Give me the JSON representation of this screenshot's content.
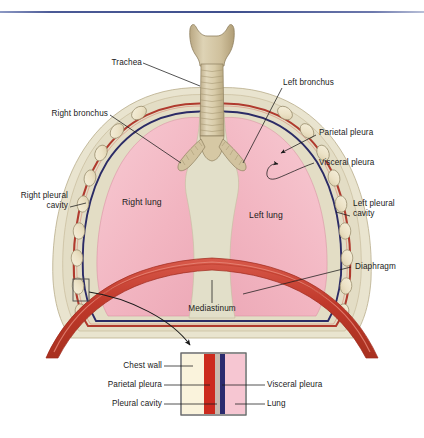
{
  "figure": {
    "background_color": "#ffffff",
    "top_rule_color": "#4b5a96"
  },
  "colors": {
    "lung_pink": "#f4b9c4",
    "lung_pink_light": "#f7c8d1",
    "chest_wall_cream": "#ddd9c3",
    "chest_wall_outer": "#e7e2cc",
    "rib_fill": "#eee6cf",
    "rib_outline": "#9a8e6e",
    "parietal_red": "#b03a2e",
    "visceral_navy": "#2b2b66",
    "diaphragm_red": "#c0392b",
    "diaphragm_red_light": "#e05a4a",
    "mediastinum": "#e0decb",
    "trachea_tan": "#cdbf9e",
    "trachea_light": "#ded2b4",
    "leader_line": "#1a1a1a",
    "label_text": "#1a1a1a",
    "inset_chest_wall": "#faf3dc",
    "inset_parietal": "#cc2a1e",
    "inset_cavity": "#2b2b6e",
    "inset_lung": "#f6c6d2",
    "inset_border": "#6b6b6b"
  },
  "labels": {
    "trachea": "Trachea",
    "right_bronchus": "Right bronchus",
    "left_bronchus": "Left bronchus",
    "parietal_pleura": "Parietal pleura",
    "visceral_pleura": "Visceral pleura",
    "right_pleural_cavity_line1": "Right pleural",
    "right_pleural_cavity_line2": "cavity",
    "left_pleural_cavity_line1": "Left pleural",
    "left_pleural_cavity_line2": "cavity",
    "right_lung": "Right lung",
    "left_lung": "Left lung",
    "diaphragm": "Diaphragm",
    "mediastinum": "Mediastinum"
  },
  "inset": {
    "left_labels": [
      "Chest wall",
      "Parietal pleura",
      "Pleural cavity"
    ],
    "right_labels": [
      "Visceral pleura",
      "Lung"
    ],
    "layers": [
      {
        "name": "chest wall",
        "color": "#faf3dc",
        "width": 22
      },
      {
        "name": "parietal pleura",
        "color": "#cc2a1e",
        "width": 11
      },
      {
        "name": "pleural cavity",
        "color": "#c8b8ae",
        "width": 5
      },
      {
        "name": "visceral pleura",
        "color": "#2b2b6e",
        "width": 5
      },
      {
        "name": "lung",
        "color": "#f6c6d2",
        "width": 22
      }
    ]
  }
}
